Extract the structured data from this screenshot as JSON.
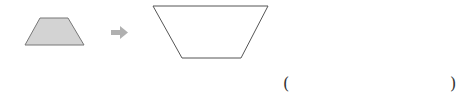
{
  "problem": {
    "small_shape": {
      "type": "trapezoid",
      "fill": "#d3d3d3",
      "stroke": "#777777"
    },
    "arrow": {
      "icon": "right-arrow-icon",
      "color": "#b0b0b0"
    },
    "large_shape": {
      "type": "inverted-trapezoid",
      "fill": "#ffffff",
      "stroke": "#555555"
    },
    "answer": {
      "open": "(",
      "close": ")",
      "value": ""
    }
  }
}
